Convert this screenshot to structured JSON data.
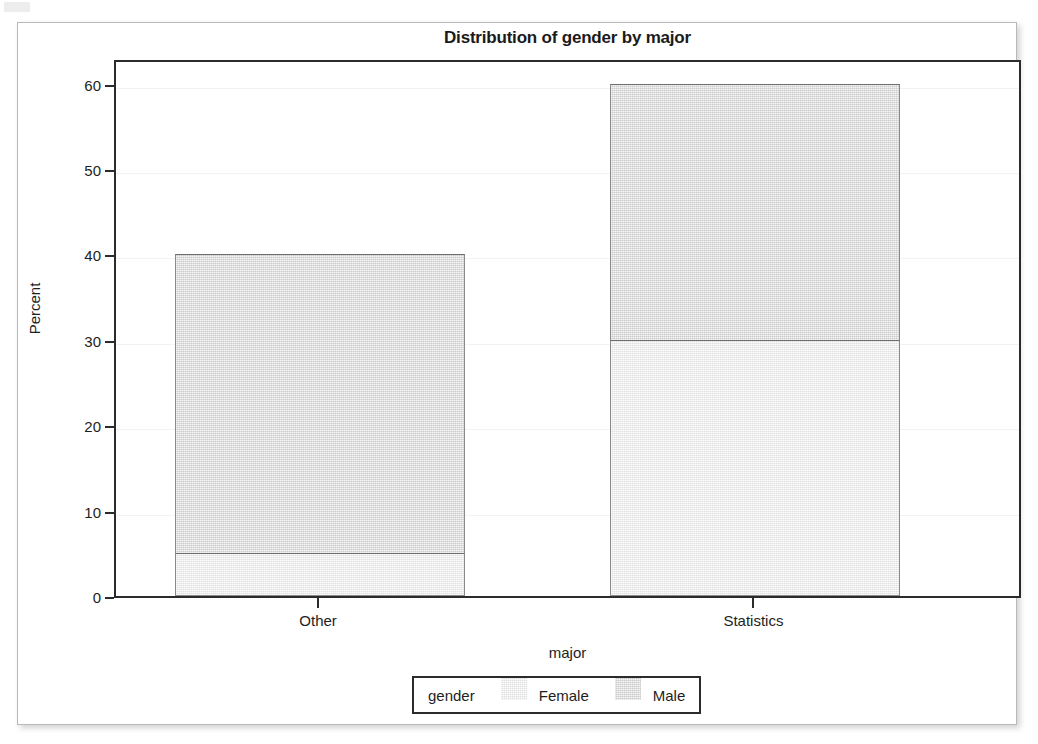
{
  "chart_data": {
    "type": "bar",
    "stacked": true,
    "title": "Distribution of gender by major",
    "xlabel": "major",
    "ylabel": "Percent",
    "categories": [
      "Other",
      "Statistics"
    ],
    "series": [
      {
        "name": "Female",
        "values": [
          5,
          30
        ],
        "color": "#e9e9e9"
      },
      {
        "name": "Male",
        "values": [
          35,
          30
        ],
        "color": "#d9d9d9"
      }
    ],
    "totals": [
      40,
      60
    ],
    "segment_boundaries": [
      {
        "category": "Other",
        "female_top": 5,
        "male_top": 40
      },
      {
        "category": "Statistics",
        "female_top": 30,
        "male_top": 60
      }
    ],
    "ylim": [
      0,
      63
    ],
    "yticks": [
      0,
      10,
      20,
      30,
      40,
      50,
      60
    ],
    "ytick_labels": [
      "0",
      "10",
      "20",
      "30",
      "40",
      "50",
      "60"
    ],
    "grid": true,
    "grid_color": "#f2f2f2",
    "legend": {
      "title": "gender",
      "position": "bottom",
      "entries": [
        "Female",
        "Male"
      ]
    },
    "frame_color": "#2b2b2b",
    "bar_outline_color": "#8a8a8a",
    "background": "#ffffff"
  }
}
